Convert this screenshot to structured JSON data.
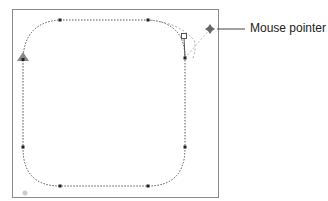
{
  "callout": {
    "label": "Mouse pointer"
  },
  "colors": {
    "frame": "#8a8a8a",
    "path": "#555555",
    "guide": "#aaaaaa",
    "anchor": "#222222",
    "background": "#ffffff"
  },
  "icons": {
    "pointer": "move-pointer-icon",
    "start": "start-arrow-icon",
    "handle": "control-handle-icon"
  }
}
